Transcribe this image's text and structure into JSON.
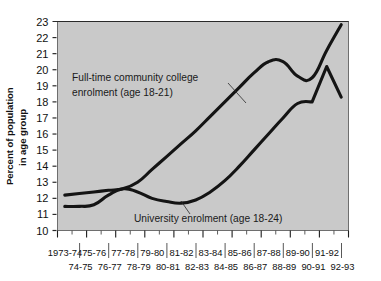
{
  "chart_data": {
    "type": "line",
    "title": "",
    "xlabel": "",
    "ylabel_line1": "Percent of population",
    "ylabel_line2": "in age group",
    "ylim": [
      10,
      23
    ],
    "yticks": [
      10,
      11,
      12,
      13,
      14,
      15,
      16,
      17,
      18,
      19,
      20,
      21,
      22,
      23
    ],
    "grid": false,
    "legend_position": "inline-annotations",
    "categories_top": [
      "1973-74",
      "75-76",
      "77-78",
      "79-80",
      "81-82",
      "83-84",
      "85-86",
      "87-88",
      "89-90",
      "91-92"
    ],
    "categories_bottom": [
      "74-75",
      "76-77",
      "78-79",
      "80-81",
      "82-83",
      "84-85",
      "86-87",
      "88-89",
      "90-91",
      "92-93"
    ],
    "x": [
      "1973-74",
      "74-75",
      "75-76",
      "76-77",
      "77-78",
      "78-79",
      "79-80",
      "80-81",
      "81-82",
      "82-83",
      "83-84",
      "84-85",
      "85-86",
      "86-87",
      "87-88",
      "88-89",
      "89-90",
      "90-91",
      "91-92",
      "92-93"
    ],
    "series": [
      {
        "name": "Full-time community college enrolment (age 18-21)",
        "annotation_line1": "Full-time community college",
        "annotation_line2": "enrolment (age 18-21)",
        "values": [
          12.2,
          12.3,
          12.4,
          12.5,
          12.6,
          13.0,
          13.8,
          14.6,
          15.4,
          16.2,
          17.1,
          18.0,
          18.9,
          19.8,
          20.5,
          20.5,
          19.6,
          19.5,
          21.2,
          22.8
        ]
      },
      {
        "name": "University enrolment (age 18-24)",
        "annotation_line1": "University enrolment (age 18-24)",
        "values": [
          11.5,
          11.5,
          11.6,
          12.2,
          12.6,
          12.4,
          12.0,
          11.8,
          11.7,
          11.9,
          12.4,
          13.1,
          14.0,
          15.0,
          16.0,
          17.0,
          17.9,
          18.0,
          20.2,
          18.3
        ]
      }
    ]
  },
  "annotations": {
    "community_label_line1": "Full-time community college",
    "community_label_line2": "enrolment (age 18-21)",
    "university_label": "University enrolment (age 18-24)"
  }
}
